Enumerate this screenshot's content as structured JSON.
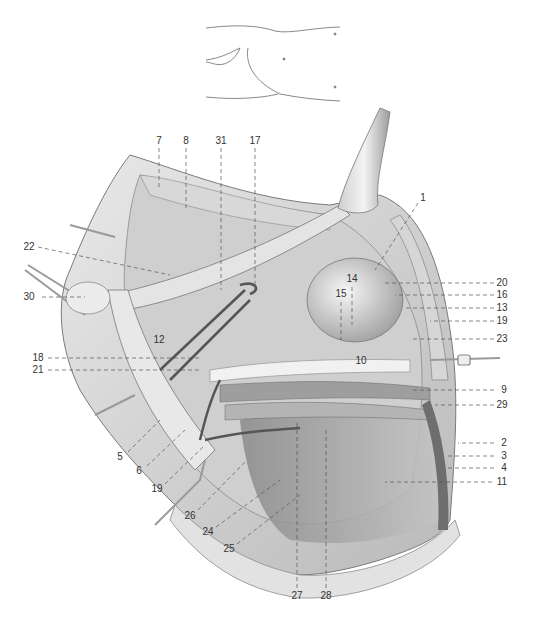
{
  "figure": {
    "type": "anatomical-illustration",
    "inset": {
      "description": "Orientation sketch of lower trunk and thigh"
    }
  },
  "labels": [
    {
      "id": "1",
      "text": "1",
      "x": 423,
      "y": 198
    },
    {
      "id": "2",
      "text": "2",
      "x": 504,
      "y": 443
    },
    {
      "id": "3",
      "text": "3",
      "x": 504,
      "y": 456
    },
    {
      "id": "4",
      "text": "4",
      "x": 504,
      "y": 468
    },
    {
      "id": "5",
      "text": "5",
      "x": 120,
      "y": 457
    },
    {
      "id": "6",
      "text": "6",
      "x": 139,
      "y": 471
    },
    {
      "id": "7",
      "text": "7",
      "x": 159,
      "y": 141
    },
    {
      "id": "8",
      "text": "8",
      "x": 186,
      "y": 141
    },
    {
      "id": "9",
      "text": "9",
      "x": 504,
      "y": 390
    },
    {
      "id": "10",
      "text": "10",
      "x": 361,
      "y": 361
    },
    {
      "id": "11",
      "text": "11",
      "x": 502,
      "y": 482
    },
    {
      "id": "12",
      "text": "12",
      "x": 159,
      "y": 340
    },
    {
      "id": "13",
      "text": "13",
      "x": 502,
      "y": 308
    },
    {
      "id": "14",
      "text": "14",
      "x": 352,
      "y": 279
    },
    {
      "id": "15",
      "text": "15",
      "x": 341,
      "y": 294
    },
    {
      "id": "16",
      "text": "16",
      "x": 502,
      "y": 295
    },
    {
      "id": "17",
      "text": "17",
      "x": 255,
      "y": 141
    },
    {
      "id": "18",
      "text": "18",
      "x": 38,
      "y": 358
    },
    {
      "id": "19",
      "text": "19",
      "x": 502,
      "y": 321
    },
    {
      "id": "19b",
      "text": "19",
      "x": 157,
      "y": 489
    },
    {
      "id": "20",
      "text": "20",
      "x": 502,
      "y": 283
    },
    {
      "id": "21",
      "text": "21",
      "x": 38,
      "y": 370
    },
    {
      "id": "22",
      "text": "22",
      "x": 29,
      "y": 247
    },
    {
      "id": "23",
      "text": "23",
      "x": 502,
      "y": 339
    },
    {
      "id": "24",
      "text": "24",
      "x": 208,
      "y": 532
    },
    {
      "id": "25",
      "text": "25",
      "x": 229,
      "y": 549
    },
    {
      "id": "26",
      "text": "26",
      "x": 190,
      "y": 516
    },
    {
      "id": "27",
      "text": "27",
      "x": 297,
      "y": 596
    },
    {
      "id": "28",
      "text": "28",
      "x": 326,
      "y": 596
    },
    {
      "id": "29",
      "text": "29",
      "x": 502,
      "y": 405
    },
    {
      "id": "30",
      "text": "30",
      "x": 29,
      "y": 297
    },
    {
      "id": "31",
      "text": "31",
      "x": 221,
      "y": 141
    }
  ],
  "colors": {
    "background": "#ffffff",
    "label_text": "#333333",
    "leader_line": "#555555",
    "tissue_light": "#e6e6e6",
    "tissue_mid": "#bdbdbd",
    "tissue_dark": "#6e6e6e"
  }
}
